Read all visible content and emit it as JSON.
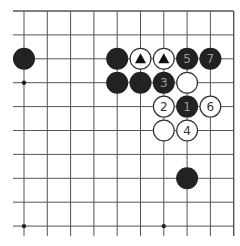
{
  "diagram": {
    "type": "go-board-fragment",
    "region": "top-right corner of 19x19 board",
    "visible_columns": 10,
    "visible_rows": 10,
    "edges": {
      "top": true,
      "right": true,
      "left": false,
      "bottom": false
    },
    "grid": {
      "x0": 24,
      "y0": 11,
      "dx": 23.3,
      "dy": 23.9,
      "line_color": "#555555",
      "left_overhang": 11,
      "bottom_overhang": 10
    },
    "star_points": [
      {
        "col": 0,
        "row": 3
      },
      {
        "col": 6,
        "row": 3
      },
      {
        "col": 0,
        "row": 9
      },
      {
        "col": 6,
        "row": 9
      }
    ],
    "colors": {
      "black_stone": "#222222",
      "black_stone_text": "#9a9a9a",
      "white_stone": "#ffffff",
      "white_stone_border": "#333333",
      "white_stone_text": "#333333",
      "triangle_mark": "#111111"
    },
    "stones": [
      {
        "color": "black",
        "col": 0,
        "row": 2,
        "label": "",
        "mark": ""
      },
      {
        "color": "black",
        "col": 4,
        "row": 2,
        "label": "",
        "mark": ""
      },
      {
        "color": "white",
        "col": 5,
        "row": 2,
        "label": "",
        "mark": "triangle"
      },
      {
        "color": "white",
        "col": 6,
        "row": 2,
        "label": "",
        "mark": "triangle"
      },
      {
        "color": "black",
        "col": 7,
        "row": 2,
        "label": "5",
        "mark": ""
      },
      {
        "color": "black",
        "col": 8,
        "row": 2,
        "label": "7",
        "mark": ""
      },
      {
        "color": "black",
        "col": 4,
        "row": 3,
        "label": "",
        "mark": ""
      },
      {
        "color": "black",
        "col": 5,
        "row": 3,
        "label": "",
        "mark": ""
      },
      {
        "color": "black",
        "col": 6,
        "row": 3,
        "label": "3",
        "mark": ""
      },
      {
        "color": "white",
        "col": 7,
        "row": 3,
        "label": "",
        "mark": ""
      },
      {
        "color": "white",
        "col": 6,
        "row": 4,
        "label": "2",
        "mark": ""
      },
      {
        "color": "black",
        "col": 7,
        "row": 4,
        "label": "1",
        "mark": ""
      },
      {
        "color": "white",
        "col": 8,
        "row": 4,
        "label": "6",
        "mark": ""
      },
      {
        "color": "white",
        "col": 6,
        "row": 5,
        "label": "",
        "mark": ""
      },
      {
        "color": "white",
        "col": 7,
        "row": 5,
        "label": "4",
        "mark": ""
      },
      {
        "color": "black",
        "col": 7,
        "row": 7,
        "label": "",
        "mark": ""
      }
    ]
  }
}
